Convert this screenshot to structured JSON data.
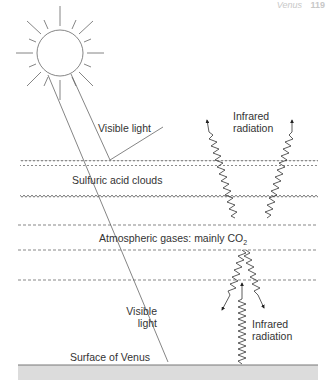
{
  "header": {
    "title": "Venus",
    "page_number": "119"
  },
  "labels": {
    "visible_light_top": "Visible light",
    "infrared_top_line1": "Infrared",
    "infrared_top_line2": "radiation",
    "clouds": "Sulfuric acid clouds",
    "atmosphere": "Atmospheric gases: mainly CO",
    "atmosphere_subscript": "2",
    "visible_light_bottom_line1": "Visible",
    "visible_light_bottom_line2": "light",
    "infrared_bottom_line1": "Infrared",
    "infrared_bottom_line2": "radiation",
    "surface": "Surface of Venus"
  },
  "colors": {
    "line": "#555555",
    "surface_band": "#dddddd",
    "surface_line": "#777777",
    "text": "#333333"
  },
  "layers": [
    {
      "name": "sulfuric-acid-cloud-top",
      "style": "wavy",
      "y": 163
    },
    {
      "name": "sulfuric-acid-cloud-bottom",
      "style": "wavy",
      "y": 198
    },
    {
      "name": "atmosphere-line-1",
      "style": "dashed",
      "y": 225
    },
    {
      "name": "atmosphere-line-2",
      "style": "dashed",
      "y": 250
    },
    {
      "name": "atmosphere-line-3",
      "style": "dashed",
      "y": 280
    },
    {
      "name": "surface",
      "style": "solid",
      "y": 365
    }
  ]
}
